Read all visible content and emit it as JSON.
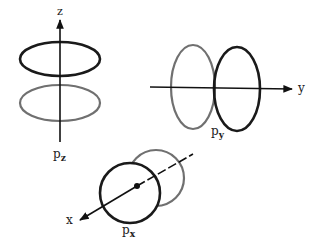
{
  "diagram": {
    "type": "p-orbitals",
    "colors": {
      "dark": "#1a1a1a",
      "light": "#707070",
      "axis": "#111111"
    },
    "orbitals": [
      {
        "id": "pz",
        "axis_label": "z",
        "orbital_label": "p",
        "orbital_subscript": "z"
      },
      {
        "id": "py",
        "axis_label": "y",
        "orbital_label": "p",
        "orbital_subscript": "y"
      },
      {
        "id": "px",
        "axis_label": "x",
        "orbital_label": "p",
        "orbital_subscript": "x"
      }
    ]
  }
}
